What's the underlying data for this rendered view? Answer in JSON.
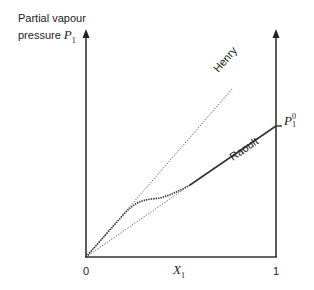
{
  "diagram": {
    "y_axis_label_line1": "Partial vapour",
    "y_axis_label_line2": "pressure",
    "y_axis_symbol": "P",
    "y_axis_symbol_sub": "1",
    "x_axis_symbol": "X",
    "x_axis_symbol_sub": "1",
    "x_tick_start": "0",
    "x_tick_end": "1",
    "p_sat_symbol": "P",
    "p_sat_sub": "1",
    "p_sat_sup": "0",
    "henry_label": "Henry",
    "raoult_label": "Raoult",
    "colors": {
      "line": "#333333",
      "text": "#222222"
    }
  }
}
